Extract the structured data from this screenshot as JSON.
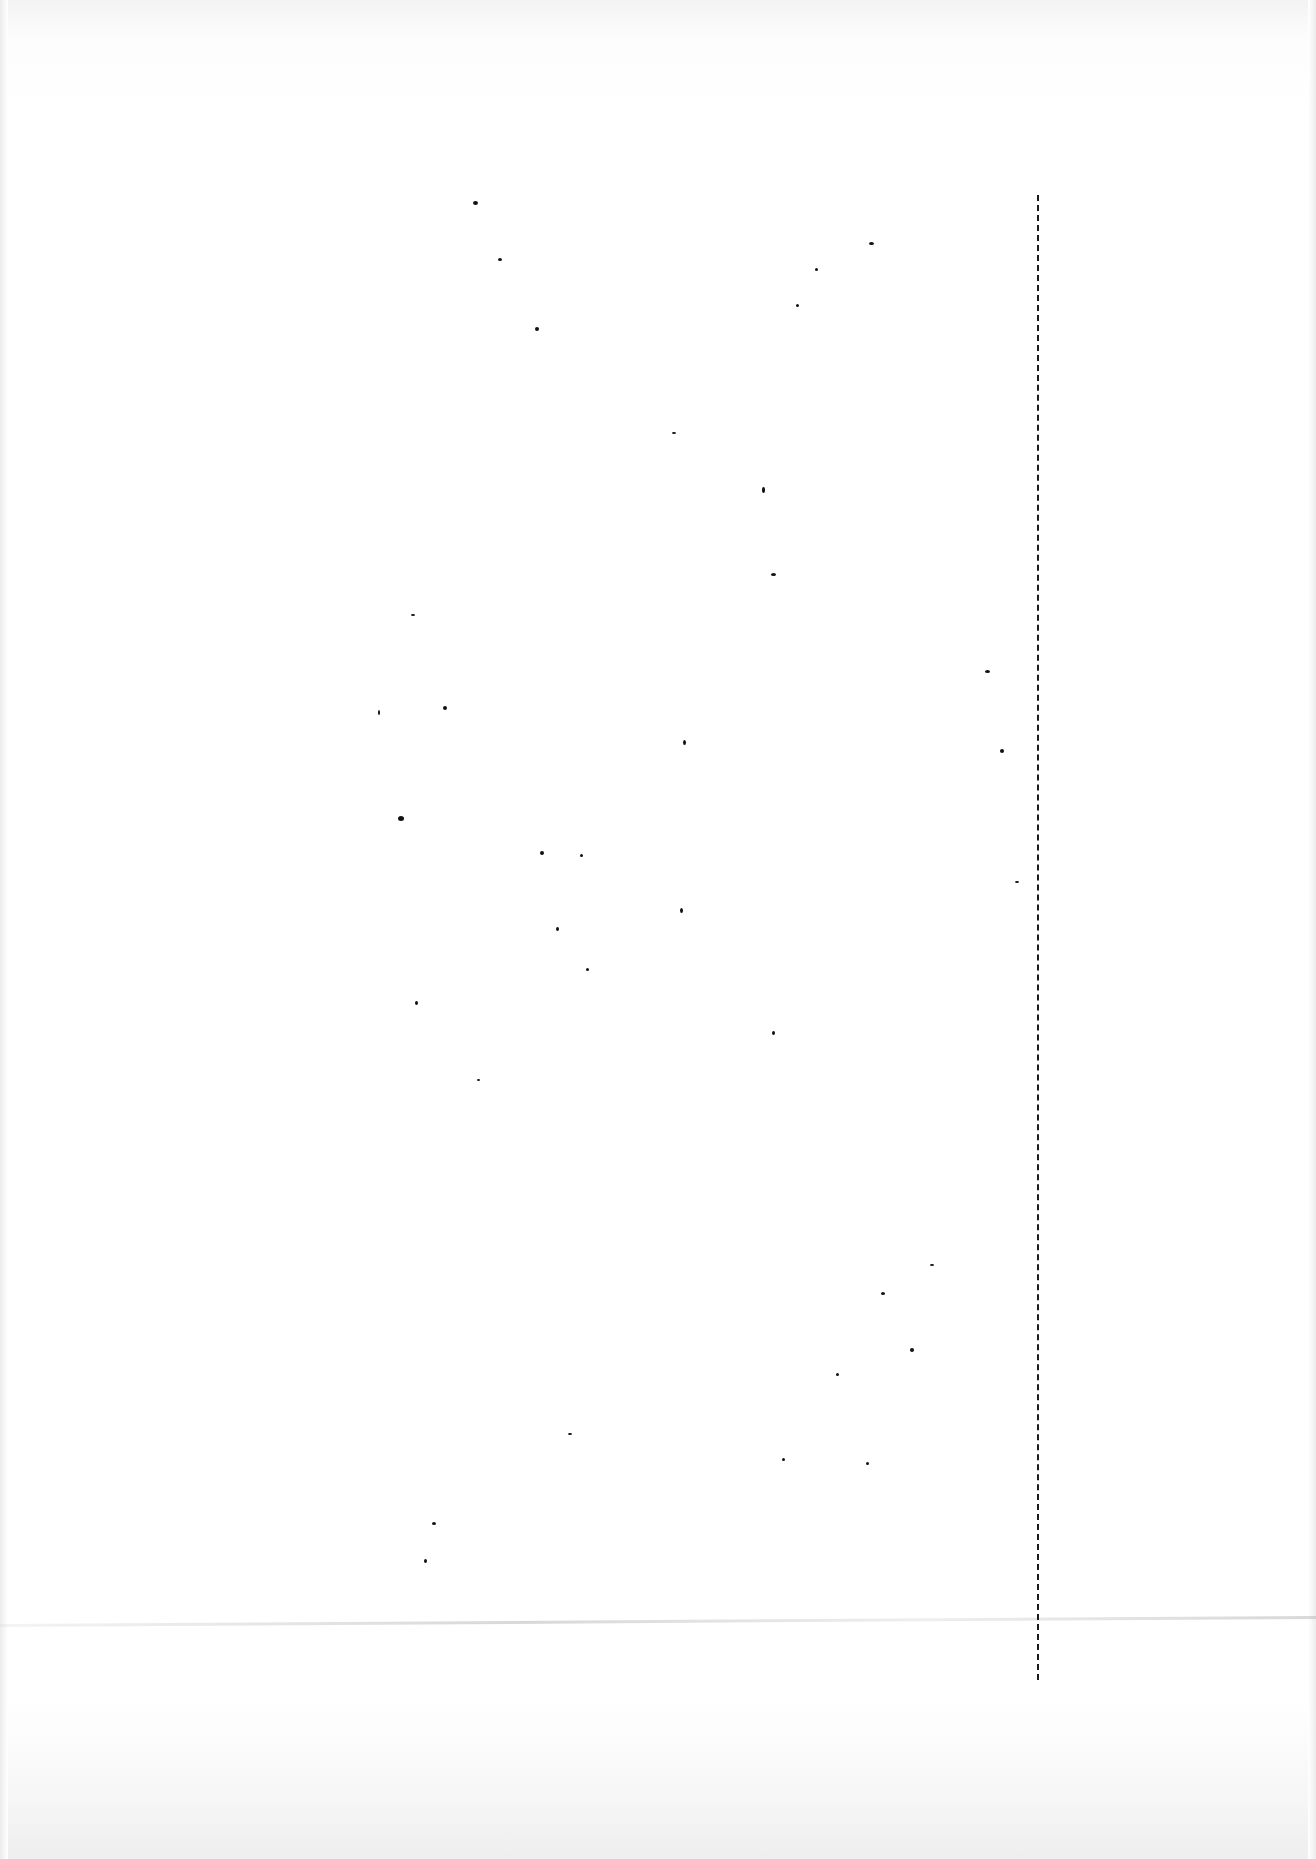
{
  "page": {
    "background": "#ffffff",
    "ink_color": "#111111",
    "text": "",
    "vertical_rule": {
      "x": 1037,
      "y_start": 195,
      "y_end": 1680,
      "style": "dashed"
    },
    "specks": [
      [
        473,
        201,
        5,
        4
      ],
      [
        498,
        258,
        4,
        3
      ],
      [
        535,
        327,
        4,
        4
      ],
      [
        672,
        432,
        4,
        2
      ],
      [
        762,
        487,
        3,
        6
      ],
      [
        771,
        573,
        5,
        3
      ],
      [
        869,
        242,
        5,
        3
      ],
      [
        815,
        268,
        3,
        3
      ],
      [
        796,
        304,
        3,
        3
      ],
      [
        411,
        614,
        4,
        2
      ],
      [
        378,
        710,
        2,
        5
      ],
      [
        443,
        706,
        4,
        4
      ],
      [
        683,
        740,
        3,
        5
      ],
      [
        985,
        670,
        5,
        3
      ],
      [
        1000,
        749,
        4,
        4
      ],
      [
        398,
        816,
        6,
        5
      ],
      [
        540,
        851,
        4,
        4
      ],
      [
        580,
        854,
        3,
        3
      ],
      [
        1015,
        881,
        4,
        2
      ],
      [
        680,
        908,
        3,
        5
      ],
      [
        556,
        927,
        3,
        4
      ],
      [
        586,
        968,
        3,
        3
      ],
      [
        415,
        1001,
        3,
        4
      ],
      [
        772,
        1031,
        3,
        4
      ],
      [
        477,
        1079,
        3,
        2
      ],
      [
        930,
        1264,
        4,
        2
      ],
      [
        881,
        1292,
        4,
        3
      ],
      [
        910,
        1348,
        4,
        4
      ],
      [
        836,
        1373,
        3,
        3
      ],
      [
        568,
        1433,
        4,
        2
      ],
      [
        782,
        1458,
        3,
        3
      ],
      [
        866,
        1462,
        3,
        3
      ],
      [
        432,
        1522,
        4,
        3
      ],
      [
        424,
        1559,
        3,
        4
      ]
    ]
  }
}
